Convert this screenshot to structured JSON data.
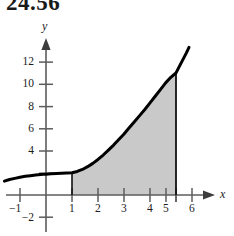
{
  "figure": {
    "problem_number": "24.56",
    "background_color": "#ffffff"
  },
  "chart_data": {
    "type": "area",
    "title": "",
    "subtitle": "",
    "xlabel": "x",
    "ylabel": "y",
    "xlim": [
      -1.8,
      6.6
    ],
    "ylim": [
      -2.6,
      13.8
    ],
    "grid": false,
    "legend": null,
    "x_ticks": [
      -1,
      1,
      2,
      3,
      4,
      5,
      6
    ],
    "x_tick_labels": [
      "−1",
      "1",
      "2",
      "3",
      "4",
      "5",
      "6"
    ],
    "y_ticks": [
      -2,
      2,
      4,
      6,
      8,
      10,
      12
    ],
    "y_tick_labels": [
      "−2",
      "",
      "4",
      "6",
      "8",
      "10",
      "12"
    ],
    "y_visible_tick_labels": [
      "12",
      "10",
      "8",
      "6",
      "4",
      "−2"
    ],
    "curve_color": "#000000",
    "shade_color": "#c9c9c9",
    "shade_region": {
      "x_start": 1,
      "x_end": 5,
      "y_at_x_start": 2.0,
      "y_at_x_end": 11.0,
      "description": "region under curve between x = 1 and x = 5"
    },
    "series": [
      {
        "name": "curve",
        "x": [
          -1.6,
          -1.4,
          -1.2,
          -1.0,
          -0.8,
          -0.6,
          -0.4,
          -0.2,
          0.0,
          0.2,
          0.4,
          0.6,
          0.8,
          1.0,
          1.2,
          1.4,
          1.6,
          1.8,
          2.0,
          2.2,
          2.4,
          2.6,
          2.8,
          3.0,
          3.2,
          3.4,
          3.6,
          3.8,
          4.0,
          4.2,
          4.4,
          4.6,
          4.8,
          5.0,
          5.2,
          5.4,
          5.5
        ],
        "y": [
          1.25,
          1.4,
          1.5,
          1.6,
          1.68,
          1.74,
          1.8,
          1.84,
          1.88,
          1.91,
          1.94,
          1.96,
          1.98,
          2.0,
          2.12,
          2.3,
          2.55,
          2.85,
          3.2,
          3.6,
          4.05,
          4.5,
          5.0,
          5.5,
          6.05,
          6.6,
          7.15,
          7.7,
          8.3,
          8.9,
          9.5,
          10.1,
          10.6,
          11.0,
          11.9,
          12.8,
          13.3
        ]
      }
    ]
  }
}
